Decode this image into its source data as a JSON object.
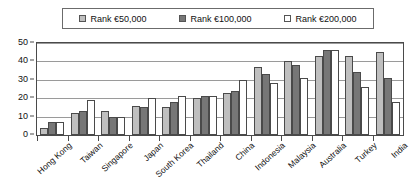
{
  "chart_data": {
    "type": "bar",
    "title": "",
    "subtitle": "",
    "xlabel": "",
    "ylabel": "",
    "ylim": [
      0,
      50
    ],
    "yticks": [
      0,
      10,
      20,
      30,
      40,
      50
    ],
    "grid": true,
    "legend_position": "top",
    "categories": [
      "Hong Kong",
      "Taiwan",
      "Singapore",
      "Japan",
      "South Korea",
      "Thailand",
      "China",
      "Indonesia",
      "Malaysia",
      "Australia",
      "Turkey",
      "India"
    ],
    "series": [
      {
        "name": "Rank €50,000",
        "color": "#bfbfbf",
        "values": [
          4,
          12,
          13,
          16,
          15,
          20,
          23,
          37,
          40,
          43,
          43,
          45
        ]
      },
      {
        "name": "Rank €100,000",
        "color": "#777777",
        "values": [
          7,
          13,
          10,
          15,
          18,
          21,
          24,
          33,
          38,
          46,
          34,
          31
        ]
      },
      {
        "name": "Rank €200,000",
        "color": "#ffffff",
        "values": [
          7,
          19,
          10,
          20,
          21,
          21,
          30,
          28,
          31,
          46,
          26,
          18
        ]
      }
    ]
  },
  "legend": {
    "items": [
      {
        "label": "Rank €50,000",
        "swatch": "#bfbfbf"
      },
      {
        "label": "Rank €100,000",
        "swatch": "#777777"
      },
      {
        "label": "Rank €200,000",
        "swatch": "#ffffff"
      }
    ]
  },
  "axes": {
    "y_tick_labels": [
      "50",
      "40",
      "30",
      "20",
      "10",
      "0"
    ]
  }
}
